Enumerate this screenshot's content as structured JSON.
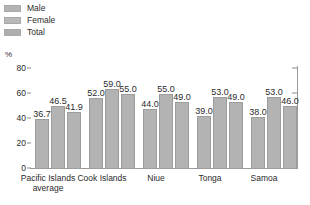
{
  "legend": {
    "items": [
      {
        "label": "Male",
        "color": "#b3b3b3"
      },
      {
        "label": "Female",
        "color": "#b8b8b8"
      },
      {
        "label": "Total",
        "color": "#aeaeae"
      }
    ]
  },
  "axis": {
    "unit": "%",
    "yticks": [
      "0",
      "20",
      "40",
      "60",
      "80"
    ]
  },
  "chart_data": {
    "type": "bar",
    "title": "",
    "subtitle": "",
    "xlabel": "",
    "ylabel": "%",
    "ylim": [
      0,
      80
    ],
    "yticks": [
      0,
      20,
      40,
      60,
      80
    ],
    "grid": false,
    "legend_position": "top-left",
    "categories": [
      "Pacific Islands\naverage",
      "Cook Islands",
      "Niue",
      "Tonga",
      "Samoa"
    ],
    "series": [
      {
        "name": "Male",
        "values": [
          36.7,
          52.0,
          44.0,
          39.0,
          38.0
        ]
      },
      {
        "name": "Female",
        "values": [
          46.5,
          59.0,
          55.0,
          53.0,
          53.0
        ]
      },
      {
        "name": "Total",
        "values": [
          41.9,
          55.0,
          49.0,
          49.0,
          46.0
        ]
      }
    ],
    "data_labels": [
      [
        "36.7",
        "46.5",
        "41.9"
      ],
      [
        "52.0",
        "59.0",
        "55.0"
      ],
      [
        "44.0",
        "55.0",
        "49.0"
      ],
      [
        "39.0",
        "53.0",
        "49.0"
      ],
      [
        "38.0",
        "53.0",
        "46.0"
      ]
    ]
  }
}
